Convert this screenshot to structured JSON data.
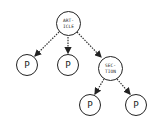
{
  "diagram": {
    "type": "tree",
    "nodes": [
      {
        "id": "article",
        "line1": "ART-",
        "line2": "ICLE"
      },
      {
        "id": "p1",
        "label": "P"
      },
      {
        "id": "p2",
        "label": "P"
      },
      {
        "id": "section",
        "line1": "SEC-",
        "line2": "TION"
      },
      {
        "id": "p3",
        "label": "P"
      },
      {
        "id": "p4",
        "label": "P"
      }
    ],
    "edges": [
      {
        "from": "article",
        "to": "p1",
        "style": "dotted-arrow"
      },
      {
        "from": "article",
        "to": "p2",
        "style": "dotted-arrow"
      },
      {
        "from": "article",
        "to": "section",
        "style": "dotted-arrow"
      },
      {
        "from": "section",
        "to": "p3",
        "style": "dotted-arrow"
      },
      {
        "from": "section",
        "to": "p4",
        "style": "dotted-arrow"
      }
    ]
  }
}
